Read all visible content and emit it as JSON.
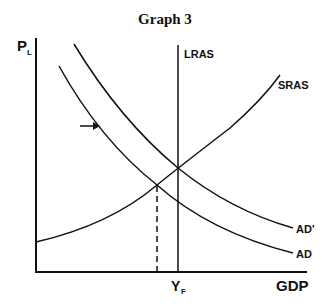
{
  "title": "Graph 3",
  "axes": {
    "y_label": "P",
    "y_sub": "L",
    "x_label": "GDP",
    "yf_label": "Y",
    "yf_sub": "F"
  },
  "curves": {
    "lras": "LRAS",
    "sras": "SRAS",
    "ad_prime": "AD'",
    "ad": "AD"
  },
  "annotation": {
    "arrow": "right-arrow shift AD to AD'"
  },
  "colors": {
    "line": "#111111",
    "background": "#ffffff"
  }
}
